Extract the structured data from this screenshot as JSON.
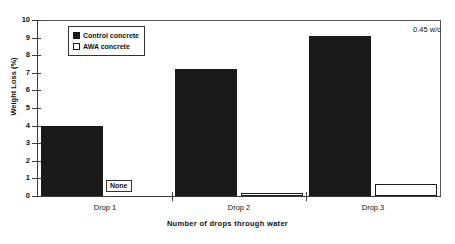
{
  "chart_data": {
    "type": "bar",
    "title": "",
    "subtitle": "",
    "xlabel": "Number of drops through water",
    "ylabel": "Weight Loss (%)",
    "categories": [
      "Drop 1",
      "Drop 2",
      "Drop 3"
    ],
    "series": [
      {
        "name": "Control concrete",
        "values": [
          4.0,
          7.2,
          9.1
        ],
        "color": "#1a1a1a"
      },
      {
        "name": "AWA concrete",
        "values": [
          null,
          0.15,
          0.7
        ],
        "color": "#ffffff"
      }
    ],
    "ylim": [
      0,
      10
    ],
    "yticks": [
      0,
      1,
      2,
      3,
      4,
      5,
      6,
      7,
      8,
      9,
      10
    ],
    "ytick_labels": [
      "0",
      "1",
      "2",
      "3",
      "4",
      "5",
      "6",
      "7",
      "8",
      "9",
      "10"
    ],
    "grid": false,
    "legend_position": "upper-left-inside",
    "annotations": [
      {
        "name": "water-cement-ratio",
        "text": "0.45 w/c",
        "position": "upper-right"
      },
      {
        "name": "none-marker",
        "text": "None",
        "position": "drop-1-awa-bar",
        "note": "AWA concrete has no measurable weight loss at Drop 1"
      }
    ]
  },
  "legend": {
    "items": [
      {
        "label": "Control concrete",
        "swatch": "filled-black-square"
      },
      {
        "label": "AWA concrete",
        "swatch": "open-white-square"
      }
    ]
  },
  "axes": {
    "y_title": "Weight Loss (%)",
    "x_title": "Number of drops through water",
    "y_ticks": [
      "10",
      "9",
      "8",
      "7",
      "6",
      "5",
      "4",
      "3",
      "2",
      "1",
      "0"
    ],
    "x_categories": [
      "Drop 1",
      "Drop 2",
      "Drop 3"
    ]
  },
  "annotations": {
    "wc_ratio": "0.45 w/c",
    "none_label": "None"
  }
}
